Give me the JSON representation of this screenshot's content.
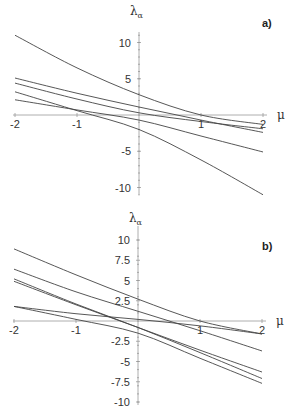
{
  "chart_data": [
    {
      "type": "line",
      "panel_label": "a)",
      "title": "",
      "xlabel": "μ",
      "ylabel": "λα",
      "xlim": [
        -2,
        2
      ],
      "ylim": [
        -11,
        11
      ],
      "xticks": [
        "-2",
        "-1",
        "1",
        "2"
      ],
      "yticks": [
        "10",
        "5",
        "-5",
        "-10"
      ],
      "grid": false,
      "x": [
        -2,
        -1,
        0,
        1,
        2
      ],
      "series": [
        {
          "name": "λ1",
          "values": [
            11.0,
            6.5,
            2.8,
            0.0,
            -1.3
          ]
        },
        {
          "name": "λ2",
          "values": [
            5.1,
            3.0,
            1.1,
            -0.7,
            -2.4
          ]
        },
        {
          "name": "λ3",
          "values": [
            4.4,
            2.2,
            0.3,
            -0.9,
            -1.9
          ]
        },
        {
          "name": "λ4",
          "values": [
            3.2,
            0.6,
            -2.0,
            -6.2,
            -11.0
          ]
        },
        {
          "name": "λ5",
          "values": [
            2.1,
            0.7,
            -0.7,
            -2.9,
            -5.1
          ]
        }
      ]
    },
    {
      "type": "line",
      "panel_label": "b)",
      "title": "",
      "xlabel": "μ",
      "ylabel": "λα",
      "xlim": [
        -2,
        2
      ],
      "ylim": [
        -10,
        10
      ],
      "xticks": [
        "-2",
        "-1",
        "1",
        "2"
      ],
      "yticks": [
        "10",
        "7.5",
        "5",
        "2.5",
        "-2.5",
        "-5",
        "-7.5",
        "-10"
      ],
      "grid": false,
      "x": [
        -2,
        -1,
        0,
        1,
        2
      ],
      "series": [
        {
          "name": "λ1",
          "values": [
            8.9,
            5.7,
            2.7,
            0.0,
            -1.6
          ]
        },
        {
          "name": "λ2",
          "values": [
            6.4,
            3.6,
            1.2,
            -1.2,
            -3.7
          ]
        },
        {
          "name": "λ3",
          "values": [
            5.2,
            2.1,
            -0.8,
            -3.9,
            -7.1
          ]
        },
        {
          "name": "λ4",
          "values": [
            4.9,
            2.0,
            -0.8,
            -3.6,
            -6.3
          ]
        },
        {
          "name": "λ5",
          "values": [
            1.8,
            0.9,
            0.2,
            -0.6,
            -1.6
          ]
        },
        {
          "name": "λ6",
          "values": [
            1.8,
            0.2,
            -1.5,
            -4.6,
            -7.7
          ]
        }
      ]
    }
  ]
}
